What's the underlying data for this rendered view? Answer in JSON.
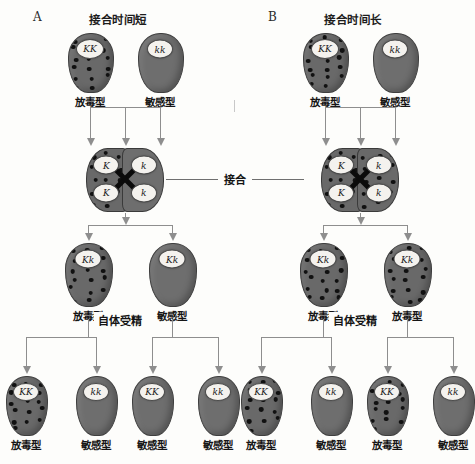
{
  "figure": {
    "background_color": "#fdfdfb",
    "cell_fill": "#6e6e6e",
    "killer_fill": "#696969",
    "nucleus_fill": "#f4f2ee",
    "kappa_particle_color": "#111111",
    "connector_color": "#8e8e8e",
    "conjugation_label": "接合",
    "autogamy_label": "自体受精",
    "labels": {
      "killer": "放毒型",
      "sensitive": "敏感型"
    }
  },
  "panels": [
    {
      "letter": "A",
      "title": "接合时间短",
      "parents": [
        {
          "genotype": "KK",
          "label": "放毒型",
          "killer": true
        },
        {
          "genotype": "kk",
          "label": "敏感型",
          "killer": false
        }
      ],
      "conjugation": {
        "label": "接合",
        "left_nuclei": [
          "K",
          "K"
        ],
        "right_nuclei": [
          "k",
          "k"
        ],
        "left_killer": true,
        "right_killer": false
      },
      "exconjugants": [
        {
          "genotype": "Kk",
          "label": "放毒型",
          "killer": true
        },
        {
          "genotype": "Kk",
          "label": "敏感型",
          "killer": false
        }
      ],
      "autogamy_label": "自体受精",
      "offspring": [
        {
          "genotype": "KK",
          "label": "放毒型",
          "killer": true
        },
        {
          "genotype": "kk",
          "label": "敏感型",
          "killer": false
        },
        {
          "genotype": "KK",
          "label": "敏感型",
          "killer": false
        },
        {
          "genotype": "kk",
          "label": "敏感型",
          "killer": false
        }
      ]
    },
    {
      "letter": "B",
      "title": "接合时间长",
      "parents": [
        {
          "genotype": "KK",
          "label": "放毒型",
          "killer": true
        },
        {
          "genotype": "kk",
          "label": "敏感型",
          "killer": false
        }
      ],
      "conjugation": {
        "label": "接合",
        "left_nuclei": [
          "K",
          "K"
        ],
        "right_nuclei": [
          "k",
          "k"
        ],
        "left_killer": true,
        "right_killer": true
      },
      "exconjugants": [
        {
          "genotype": "Kk",
          "label": "放毒型",
          "killer": true
        },
        {
          "genotype": "Kk",
          "label": "放毒型",
          "killer": true
        }
      ],
      "autogamy_label": "自体受精",
      "offspring": [
        {
          "genotype": "KK",
          "label": "放毒型",
          "killer": true
        },
        {
          "genotype": "kk",
          "label": "敏感型",
          "killer": false
        },
        {
          "genotype": "KK",
          "label": "放毒型",
          "killer": true
        },
        {
          "genotype": "kk",
          "label": "敏感型",
          "killer": false
        }
      ]
    }
  ]
}
